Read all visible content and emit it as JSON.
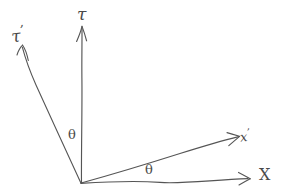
{
  "diagram": {
    "kind": "hand-drawn-sketch",
    "background_color": "#ffffff",
    "stroke_color": "#555555",
    "label_color": "#4a4a4a",
    "origin": {
      "x": 81,
      "y": 183
    },
    "labels": {
      "tau": "τ",
      "tau_prime_base": "τ",
      "tau_prime_mark": "’",
      "x": "X",
      "x_prime_base": "x",
      "x_prime_mark": "’",
      "theta_upper": "θ",
      "theta_lower": "θ"
    },
    "axes": [
      {
        "name": "tau-axis",
        "label": "τ",
        "from": {
          "x": 81,
          "y": 183
        },
        "to": {
          "x": 82,
          "y": 27
        },
        "arrowhead": "open",
        "primed": false
      },
      {
        "name": "tau-prime-axis",
        "label": "τ’",
        "from": {
          "x": 81,
          "y": 183
        },
        "to": {
          "x": 22,
          "y": 46
        },
        "arrowhead": "open",
        "primed": true
      },
      {
        "name": "x-axis",
        "label": "X",
        "from": {
          "x": 81,
          "y": 183
        },
        "to": {
          "x": 250,
          "y": 178
        },
        "arrowhead": "open",
        "primed": false
      },
      {
        "name": "x-prime-axis",
        "label": "x’",
        "from": {
          "x": 81,
          "y": 183
        },
        "to": {
          "x": 238,
          "y": 137
        },
        "arrowhead": "open",
        "primed": true
      }
    ],
    "angles": [
      {
        "name": "theta-between-tau-and-tau-prime",
        "symbol": "θ",
        "between": [
          "tau-prime-axis",
          "tau-axis"
        ],
        "label_position": {
          "x": 68,
          "y": 128
        }
      },
      {
        "name": "theta-between-x-and-x-prime",
        "symbol": "θ",
        "between": [
          "x-axis",
          "x-prime-axis"
        ],
        "label_position": {
          "x": 145,
          "y": 163
        }
      }
    ]
  }
}
